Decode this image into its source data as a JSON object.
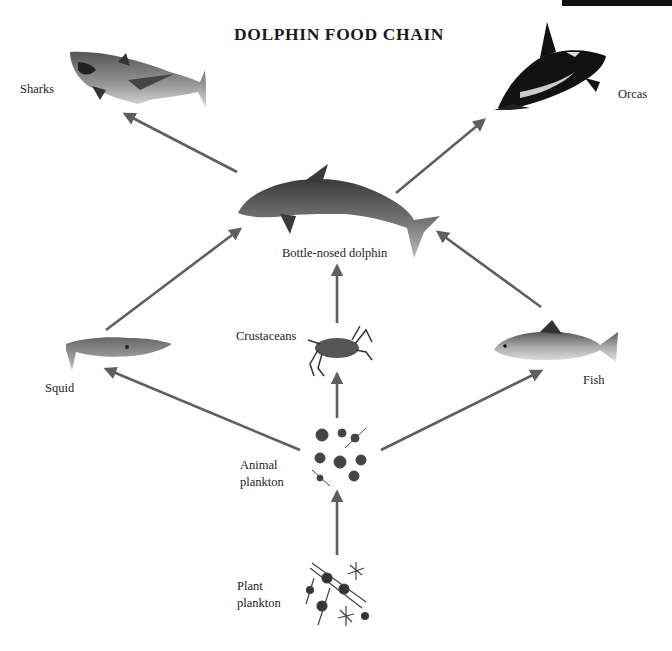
{
  "title": "DOLPHIN FOOD CHAIN",
  "colors": {
    "arrow": "#5f5f5f",
    "background": "#ffffff",
    "text": "#222222"
  },
  "nodes": {
    "sharks": {
      "label": "Sharks",
      "icon": "shark-icon"
    },
    "orcas": {
      "label": "Orcas",
      "icon": "orca-icon"
    },
    "dolphin": {
      "label": "Bottle-nosed dolphin",
      "icon": "dolphin-icon"
    },
    "squid": {
      "label": "Squid",
      "icon": "squid-icon"
    },
    "crustaceans": {
      "label": "Crustaceans",
      "icon": "crab-icon"
    },
    "fish": {
      "label": "Fish",
      "icon": "fish-icon"
    },
    "animal_plankton": {
      "label_line1": "Animal",
      "label_line2": "plankton",
      "icon": "animal-plankton-icon"
    },
    "plant_plankton": {
      "label_line1": "Plant",
      "label_line2": "plankton",
      "icon": "plant-plankton-icon"
    }
  },
  "edges": [
    {
      "from": "dolphin",
      "to": "sharks"
    },
    {
      "from": "dolphin",
      "to": "orcas"
    },
    {
      "from": "squid",
      "to": "dolphin"
    },
    {
      "from": "crustaceans",
      "to": "dolphin"
    },
    {
      "from": "fish",
      "to": "dolphin"
    },
    {
      "from": "animal_plankton",
      "to": "squid"
    },
    {
      "from": "animal_plankton",
      "to": "crustaceans"
    },
    {
      "from": "animal_plankton",
      "to": "fish"
    },
    {
      "from": "plant_plankton",
      "to": "animal_plankton"
    }
  ]
}
